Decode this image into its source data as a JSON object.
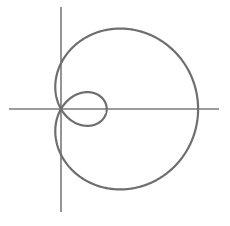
{
  "chart_data": {
    "type": "line",
    "title": "",
    "xlabel": "",
    "ylabel": "",
    "equation": "r = 1 + 2cos(theta)",
    "parameters": {
      "a": 1,
      "b": 2
    },
    "theta_range": [
      0,
      6.283185
    ],
    "grid": false,
    "legend": null,
    "key_points": {
      "outer_right_x": 3,
      "inner_loop_right_x": 1,
      "y_intercepts": [
        1,
        -1
      ],
      "pole": [
        0,
        0
      ]
    },
    "pixel_layout": {
      "origin_px": [
        61,
        109
      ],
      "scale_px_per_unit": 45.7,
      "x_axis_px": [
        9,
        219
      ],
      "y_axis_px": [
        7,
        212
      ]
    },
    "colors": {
      "axis": "#7a7a7a",
      "curve": "#6e6e6e"
    }
  }
}
